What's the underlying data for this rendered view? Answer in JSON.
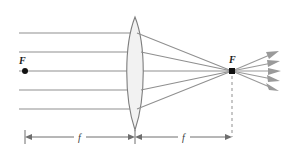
{
  "diagram": {
    "background_color": "#ffffff",
    "ray_color": "#8f8f8f",
    "lens_fill_color": "#f2f2f2",
    "lens_stroke_color": "#7d7d7d",
    "dot_color": "#111111",
    "dimension_color": "#6e6e6e",
    "labels": {
      "focal_left": "F",
      "focal_right": "F",
      "distance_left": "f",
      "distance_right": "f"
    },
    "incoming_rays": [
      {
        "y": 33
      },
      {
        "y": 52
      },
      {
        "y": 71
      },
      {
        "y": 90
      },
      {
        "y": 109
      }
    ],
    "geometry": {
      "optical_axis_y": 71,
      "lens_center_x": 135,
      "lens_top_y": 17,
      "lens_bottom_y": 130,
      "lens_half_thickness": 11,
      "focal_left_x": 25,
      "focal_right_x": 232,
      "ray_start_x": 19,
      "diverge_end_x": 279,
      "dimension_y": 137,
      "dashed_line_top_y": 74,
      "dashed_line_bottom_y": 137
    }
  }
}
